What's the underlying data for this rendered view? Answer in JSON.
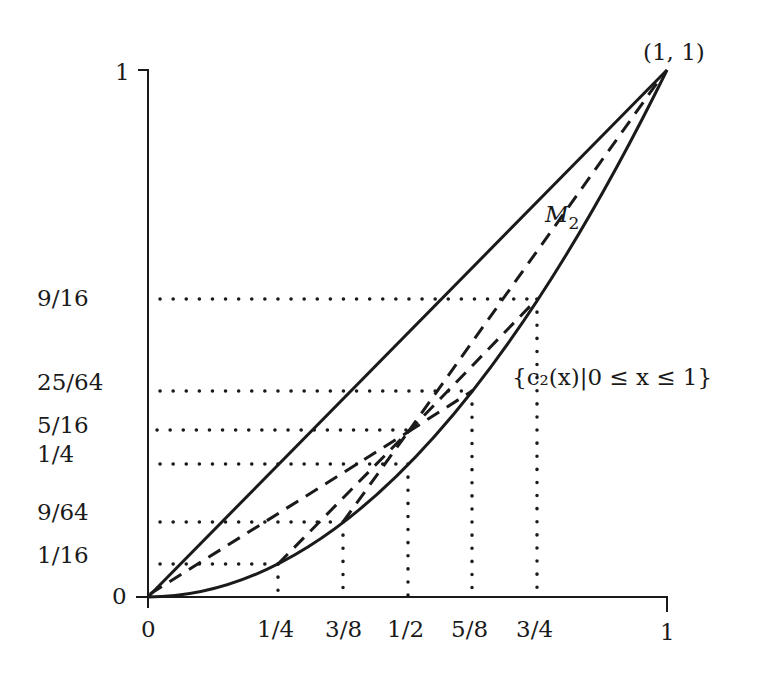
{
  "figure": {
    "y_ticks": [
      {
        "label": "1",
        "value": 1
      },
      {
        "label": "9/16",
        "value": 0.5625
      },
      {
        "label": "25/64",
        "value": 0.390625
      },
      {
        "label": "5/16",
        "value": 0.3125
      },
      {
        "label": "1/4",
        "value": 0.25
      },
      {
        "label": "9/64",
        "value": 0.140625
      },
      {
        "label": "1/16",
        "value": 0.0625
      },
      {
        "label": "0",
        "value": 0
      }
    ],
    "x_ticks": [
      {
        "label": "0",
        "value": 0
      },
      {
        "label": "1/4",
        "value": 0.25
      },
      {
        "label": "3/8",
        "value": 0.375
      },
      {
        "label": "1/2",
        "value": 0.5
      },
      {
        "label": "5/8",
        "value": 0.625
      },
      {
        "label": "3/4",
        "value": 0.75
      },
      {
        "label": "1",
        "value": 1
      }
    ],
    "point_label": "(1, 1)",
    "polygon_label": "M",
    "polygon_label_sub": "2",
    "curve_label": "{c₂(x)|0 ≤ x ≤ 1}",
    "curves": {
      "diagonal": "y = x (solid)",
      "parabola": "y = x^2 (solid)",
      "control_polygon_M2": [
        [
          [
            0,
            0
          ],
          [
            0.5,
            0.3125
          ]
        ],
        [
          [
            0.25,
            0.0625
          ],
          [
            0.5,
            0.3125
          ]
        ],
        [
          [
            0.375,
            0.140625
          ],
          [
            0.5,
            0.3125
          ]
        ],
        [
          [
            0.5,
            0.3125
          ],
          [
            0.625,
            0.390625
          ]
        ],
        [
          [
            0.5,
            0.3125
          ],
          [
            0.75,
            0.5625
          ]
        ],
        [
          [
            0.5,
            0.3125
          ],
          [
            1,
            1
          ]
        ]
      ]
    }
  }
}
